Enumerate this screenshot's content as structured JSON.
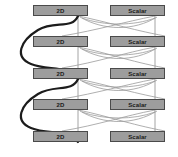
{
  "canvas": {
    "width": 178,
    "height": 157,
    "background_color": "#ffffff"
  },
  "diagram": {
    "node_fill_color": "#9d9d9d",
    "node_border_color": "#4a4a4a",
    "node_text_color": "#1a1a1a",
    "thin_edge_color": "#9a9a9a",
    "thick_edge_color": "#1c1c1c",
    "columns": [
      {
        "name": "left-column",
        "label": "2D"
      },
      {
        "name": "right-column",
        "label": "Scalar"
      }
    ],
    "rows": [
      {
        "index": 0,
        "left": {
          "label": "2D",
          "x": 33,
          "y": 5,
          "w": 55,
          "h": 11
        },
        "right": {
          "label": "Scalar",
          "x": 110,
          "y": 5,
          "w": 55,
          "h": 11
        }
      },
      {
        "index": 1,
        "left": {
          "label": "2D",
          "x": 33,
          "y": 36,
          "w": 55,
          "h": 11
        },
        "right": {
          "label": "Scalar",
          "x": 110,
          "y": 36,
          "w": 55,
          "h": 11
        }
      },
      {
        "index": 2,
        "left": {
          "label": "2D",
          "x": 33,
          "y": 68,
          "w": 55,
          "h": 11
        },
        "right": {
          "label": "Scalar",
          "x": 110,
          "y": 68,
          "w": 55,
          "h": 11
        }
      },
      {
        "index": 3,
        "left": {
          "label": "2D",
          "x": 33,
          "y": 99,
          "w": 55,
          "h": 11
        },
        "right": {
          "label": "Scalar",
          "x": 110,
          "y": 99,
          "w": 55,
          "h": 11
        }
      },
      {
        "index": 4,
        "left": {
          "label": "2D",
          "x": 33,
          "y": 131,
          "w": 55,
          "h": 11
        },
        "right": {
          "label": "Scalar",
          "x": 110,
          "y": 131,
          "w": 55,
          "h": 11
        }
      }
    ],
    "vertical_edges": [
      {
        "name": "left-spine",
        "x": 78,
        "y1": 16,
        "y2": 142
      },
      {
        "name": "right-spine",
        "x": 155,
        "y1": 16,
        "y2": 142
      }
    ],
    "arc_edges": [
      {
        "name": "arc-r0-left-to-r1-right-upper",
        "d": "M 78 16 C 110 24, 130 28, 165 36"
      },
      {
        "name": "arc-r0-right-to-r1-left-upper",
        "d": "M 155 16 C 120 24, 100 30, 62 36"
      },
      {
        "name": "arc-r0-left-bow-out",
        "d": "M 80 17 C 100 22, 140 26, 157 17"
      },
      {
        "name": "arc-r1-left-to-r2-right",
        "d": "M 78 47 C 110 55, 130 60, 165 68"
      },
      {
        "name": "arc-r1-right-to-r2-left",
        "d": "M 155 47 C 120 55, 100 62, 62 68"
      },
      {
        "name": "arc-r1-bow",
        "d": "M 80 48 C 100 54, 140 58, 157 48"
      },
      {
        "name": "arc-r2-left-to-r3-right",
        "d": "M 78 79 C 110 87, 130 91, 165 99"
      },
      {
        "name": "arc-r2-right-to-r3-left",
        "d": "M 155 79 C 120 87, 100 93, 62 99"
      },
      {
        "name": "arc-r2-bow",
        "d": "M 80 80 C 100 86, 140 90, 157 80"
      },
      {
        "name": "arc-r3-left-to-r4-right",
        "d": "M 78 110 C 110 118, 130 123, 165 131"
      },
      {
        "name": "arc-r3-right-to-r4-left",
        "d": "M 155 110 C 120 118, 100 125, 62 131"
      },
      {
        "name": "arc-r3-bow",
        "d": "M 80 111 C 100 117, 140 121, 157 111"
      }
    ],
    "thick_curve": {
      "name": "left-feedback-s-curve",
      "stroke_width": 2.2,
      "d": "M 78 16 C 70 28, 52 22, 38 30 C 20 40, 14 56, 30 64 C 46 72, 66 66, 78 79 C 70 92, 52 86, 38 94 C 20 104, 14 120, 30 128 C 46 136, 66 130, 78 142"
    }
  }
}
